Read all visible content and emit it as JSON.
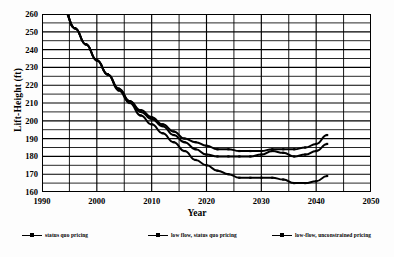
{
  "chart_data": {
    "type": "line",
    "title": "",
    "xlabel": "Year",
    "ylabel": "Lift-Height (ft)",
    "xlim": [
      1990,
      2050
    ],
    "ylim": [
      160,
      260
    ],
    "xticks": [
      1990,
      2000,
      2010,
      2020,
      2030,
      2040,
      2050
    ],
    "yticks": [
      160,
      170,
      180,
      190,
      200,
      210,
      220,
      230,
      240,
      250,
      260
    ],
    "x_minor_step": 5,
    "y_minor_step": 5,
    "grid": true,
    "legend_position": "below",
    "x": [
      1994,
      1996,
      1998,
      2000,
      2002,
      2004,
      2006,
      2008,
      2010,
      2012,
      2014,
      2016,
      2018,
      2020,
      2022,
      2024,
      2026,
      2028,
      2030,
      2032,
      2034,
      2036,
      2038,
      2040,
      2042
    ],
    "series": [
      {
        "name": "status quo pricing",
        "color": "#000000",
        "values": [
          262,
          252,
          243,
          234,
          226,
          218,
          211,
          206,
          202,
          198,
          194,
          190,
          188,
          186,
          184,
          184,
          183,
          183,
          183,
          184,
          184,
          184,
          185,
          187,
          192
        ]
      },
      {
        "name": "low flow, status quo pricing",
        "color": "#000000",
        "values": [
          262,
          252,
          243,
          234,
          226,
          218,
          211,
          205,
          201,
          197,
          192,
          188,
          184,
          181,
          180,
          180,
          180,
          180,
          181,
          183,
          182,
          180,
          181,
          183,
          187
        ]
      },
      {
        "name": "low-flow, unconstrained pricing",
        "color": "#000000",
        "values": [
          262,
          252,
          243,
          234,
          226,
          217,
          210,
          203,
          198,
          193,
          188,
          183,
          178,
          175,
          172,
          170,
          168,
          168,
          168,
          168,
          167,
          165,
          165,
          166,
          169
        ]
      }
    ]
  },
  "axes": {
    "ylabel": "Lift-Height (ft)",
    "xlabel": "Year"
  },
  "legend": {
    "items": [
      {
        "label": "status quo pricing",
        "marker": "line-square-marker"
      },
      {
        "label": "low flow, status quo pricing",
        "marker": "line-square-marker"
      },
      {
        "label": "low-flow, unconstrained pricing",
        "marker": "line-square-marker"
      }
    ]
  }
}
